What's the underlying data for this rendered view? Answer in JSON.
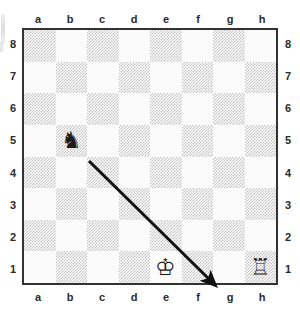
{
  "board": {
    "title": "chess-diagram",
    "files_top": [
      "a",
      "b",
      "c",
      "d",
      "e",
      "f",
      "g",
      "h"
    ],
    "files_bottom": [
      "a",
      "b",
      "c",
      "d",
      "e",
      "f",
      "g",
      "h"
    ],
    "ranks_left": [
      "8",
      "7",
      "6",
      "5",
      "4",
      "3",
      "2",
      "1"
    ],
    "ranks_right": [
      "8",
      "7",
      "6",
      "5",
      "4",
      "3",
      "2",
      "1"
    ],
    "light_square_color": "#fbfbfb",
    "dark_square_color": "#c2c2c2",
    "border_color": "#333333",
    "orientation": "white-bottom"
  },
  "pieces": [
    {
      "id": "black-knight-b5",
      "glyph": "♞",
      "color": "black",
      "type": "knight",
      "square": "b5",
      "file": 2,
      "rank": 5,
      "label": "black knight on b5"
    },
    {
      "id": "white-king-e1",
      "glyph": "♔",
      "color": "white",
      "type": "king",
      "square": "e1",
      "file": 5,
      "rank": 1,
      "label": "white king on e1"
    },
    {
      "id": "white-rook-h1",
      "glyph": "♖",
      "color": "white",
      "type": "rook",
      "square": "h1",
      "file": 8,
      "rank": 1,
      "label": "white rook on h1"
    }
  ],
  "annotations": {
    "arrow": {
      "id": "move-arrow",
      "from_square": "b5",
      "to_square": "f1",
      "color": "#111111",
      "width": 3,
      "x1": 89,
      "y1": 161,
      "x2": 212,
      "y2": 282,
      "label": "arrow from b5 toward f1"
    }
  },
  "chart_data": {
    "type": "table",
    "categories": [
      "a",
      "b",
      "c",
      "d",
      "e",
      "f",
      "g",
      "h"
    ],
    "rows": [
      "8",
      "7",
      "6",
      "5",
      "4",
      "3",
      "2",
      "1"
    ],
    "occupied": [
      {
        "square": "b5",
        "piece": "black knight"
      },
      {
        "square": "e1",
        "piece": "white king"
      },
      {
        "square": "h1",
        "piece": "white rook"
      }
    ],
    "annotations": [
      "arrow b5 → f1"
    ]
  }
}
